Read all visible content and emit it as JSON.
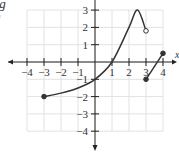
{
  "caption": {
    "line1": "ot g",
    "line2": "g"
  },
  "chart_data": {
    "type": "line",
    "title": "",
    "xlabel": "x",
    "ylabel": "",
    "xlim": [
      -4,
      4
    ],
    "ylim": [
      -4,
      3
    ],
    "grid": true,
    "x_ticks": [
      "-4",
      "-3",
      "-2",
      "-1",
      "1",
      "2",
      "3",
      "4"
    ],
    "y_ticks": [
      "3",
      "2",
      "1",
      "-1",
      "-2",
      "-3",
      "-4"
    ],
    "series": [
      {
        "name": "g piece 1",
        "points": [
          [
            -3,
            -2
          ],
          [
            -2,
            -1.8
          ],
          [
            -1,
            -1.5
          ],
          [
            0,
            -1
          ],
          [
            1,
            0
          ],
          [
            2,
            2
          ],
          [
            2.5,
            3
          ],
          [
            3,
            1.8
          ]
        ],
        "start": {
          "x": -3,
          "y": -2,
          "closed": true
        },
        "end": {
          "x": 3,
          "y": 1.8,
          "closed": false
        }
      },
      {
        "name": "g piece 2",
        "points": [
          [
            3,
            -1
          ],
          [
            4,
            0.5
          ]
        ],
        "start": {
          "x": 3,
          "y": -1,
          "closed": true
        },
        "end": {
          "x": 4,
          "y": 0.5,
          "closed": true
        }
      }
    ]
  }
}
